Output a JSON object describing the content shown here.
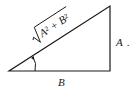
{
  "diagram": {
    "type": "right-triangle",
    "vertices": {
      "left": [
        9,
        71
      ],
      "right_angle": [
        110,
        71
      ],
      "top": [
        110,
        6
      ]
    },
    "labels": {
      "hypotenuse": "A² + B²",
      "vertical_side": "A",
      "vertical_side_suffix": ".",
      "horizontal_side": "B"
    },
    "angle_marker": "arc-with-arrow",
    "colors": {
      "stroke": "#1a1a1a",
      "background": "#ffffff"
    }
  }
}
